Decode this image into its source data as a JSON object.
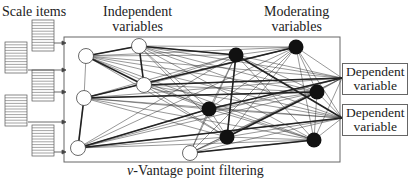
{
  "labels": {
    "scale_items": "Scale items",
    "independent_l1": "Independent",
    "independent_l2": "variables",
    "moderating_l1": "Moderating",
    "moderating_l2": "variables",
    "dependent1_l1": "Dependent",
    "dependent1_l2": "variable",
    "dependent2_l1": "Dependent",
    "dependent2_l2": "variable",
    "filter_prefix": "v",
    "filter_rest": "-Vantage point filtering",
    "caption_partial": "Figure 1 ..."
  },
  "nodes": {
    "independent": [
      [
        86,
        56
      ],
      [
        84,
        98
      ],
      [
        78,
        148
      ],
      [
        139,
        46
      ],
      [
        144,
        85
      ],
      [
        190,
        153
      ]
    ],
    "moderating": [
      [
        236,
        55
      ],
      [
        296,
        47
      ],
      [
        317,
        92
      ],
      [
        209,
        109
      ],
      [
        227,
        137
      ],
      [
        314,
        140
      ]
    ]
  },
  "colors": {
    "line": "#222",
    "box": "#666",
    "node_fill_white": "#ffffff",
    "node_fill_black": "#111111"
  }
}
